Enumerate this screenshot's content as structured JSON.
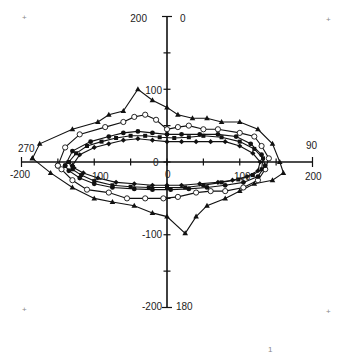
{
  "chart_data": {
    "type": "scatter",
    "subtype": "closed-loop line with markers (polar-style plot on Cartesian axes)",
    "title": "",
    "xlabel": "",
    "ylabel": "",
    "xlim": [
      -200,
      200
    ],
    "ylim": [
      -200,
      200
    ],
    "x_ticks": [
      -200,
      -150,
      -100,
      -50,
      0,
      50,
      100,
      150,
      200
    ],
    "y_ticks": [
      -200,
      -150,
      -100,
      -50,
      0,
      50,
      100,
      150,
      200
    ],
    "axis_tick_labels": {
      "y_top": "200",
      "y_upper": "100",
      "y_lower": "-100",
      "y_bottom": "-200",
      "x_left": "-200",
      "x_right": "200",
      "center_overlapping": [
        "0",
        "100",
        "100",
        "0"
      ]
    },
    "angle_labels": {
      "top": "0",
      "right": "90",
      "bottom": "180",
      "left": "270"
    },
    "grid": false,
    "legend": null,
    "series": [
      {
        "name": "series-triangle",
        "marker": "filled-triangle",
        "points": [
          [
            -185,
            5
          ],
          [
            -175,
            25
          ],
          [
            -130,
            45
          ],
          [
            -95,
            55
          ],
          [
            -80,
            65
          ],
          [
            -60,
            70
          ],
          [
            -40,
            100
          ],
          [
            -20,
            85
          ],
          [
            0,
            75
          ],
          [
            15,
            65
          ],
          [
            35,
            60
          ],
          [
            55,
            60
          ],
          [
            75,
            55
          ],
          [
            100,
            55
          ],
          [
            125,
            45
          ],
          [
            145,
            25
          ],
          [
            155,
            0
          ],
          [
            160,
            -15
          ],
          [
            145,
            -25
          ],
          [
            120,
            -30
          ],
          [
            100,
            -40
          ],
          [
            80,
            -50
          ],
          [
            55,
            -60
          ],
          [
            40,
            -75
          ],
          [
            25,
            -98
          ],
          [
            0,
            -75
          ],
          [
            -20,
            -70
          ],
          [
            -45,
            -60
          ],
          [
            -75,
            -55
          ],
          [
            -100,
            -50
          ],
          [
            -130,
            -35
          ],
          [
            -160,
            -15
          ],
          [
            -185,
            5
          ]
        ]
      },
      {
        "name": "series-open-circle",
        "marker": "open-circle",
        "points": [
          [
            -150,
            -5
          ],
          [
            -140,
            20
          ],
          [
            -120,
            38
          ],
          [
            -85,
            48
          ],
          [
            -60,
            55
          ],
          [
            -45,
            62
          ],
          [
            -30,
            65
          ],
          [
            -15,
            58
          ],
          [
            0,
            45
          ],
          [
            15,
            48
          ],
          [
            30,
            50
          ],
          [
            50,
            45
          ],
          [
            70,
            45
          ],
          [
            100,
            40
          ],
          [
            120,
            35
          ],
          [
            130,
            22
          ],
          [
            140,
            5
          ],
          [
            135,
            -10
          ],
          [
            125,
            -25
          ],
          [
            105,
            -35
          ],
          [
            80,
            -40
          ],
          [
            60,
            -40
          ],
          [
            40,
            -42
          ],
          [
            15,
            -48
          ],
          [
            -5,
            -50
          ],
          [
            -30,
            -50
          ],
          [
            -55,
            -50
          ],
          [
            -80,
            -42
          ],
          [
            -110,
            -38
          ],
          [
            -130,
            -25
          ],
          [
            -145,
            -10
          ],
          [
            -150,
            -5
          ]
        ]
      },
      {
        "name": "series-filled-circle",
        "marker": "filled-circle",
        "points": [
          [
            -140,
            -5
          ],
          [
            -130,
            15
          ],
          [
            -105,
            28
          ],
          [
            -80,
            35
          ],
          [
            -60,
            40
          ],
          [
            -40,
            42
          ],
          [
            -20,
            40
          ],
          [
            0,
            38
          ],
          [
            20,
            38
          ],
          [
            45,
            38
          ],
          [
            70,
            38
          ],
          [
            95,
            35
          ],
          [
            115,
            25
          ],
          [
            130,
            10
          ],
          [
            135,
            -5
          ],
          [
            125,
            -20
          ],
          [
            105,
            -28
          ],
          [
            80,
            -32
          ],
          [
            55,
            -35
          ],
          [
            30,
            -37
          ],
          [
            5,
            -38
          ],
          [
            -20,
            -38
          ],
          [
            -45,
            -37
          ],
          [
            -75,
            -35
          ],
          [
            -100,
            -30
          ],
          [
            -120,
            -22
          ],
          [
            -135,
            -12
          ],
          [
            -140,
            -5
          ]
        ]
      },
      {
        "name": "series-filled-diamond",
        "marker": "filled-diamond",
        "points": [
          [
            -130,
            -5
          ],
          [
            -120,
            10
          ],
          [
            -100,
            20
          ],
          [
            -80,
            25
          ],
          [
            -60,
            30
          ],
          [
            -40,
            32
          ],
          [
            -20,
            30
          ],
          [
            0,
            28
          ],
          [
            20,
            28
          ],
          [
            40,
            28
          ],
          [
            60,
            28
          ],
          [
            80,
            28
          ],
          [
            100,
            22
          ],
          [
            118,
            12
          ],
          [
            128,
            0
          ],
          [
            125,
            -12
          ],
          [
            110,
            -20
          ],
          [
            90,
            -25
          ],
          [
            70,
            -28
          ],
          [
            45,
            -30
          ],
          [
            20,
            -32
          ],
          [
            0,
            -32
          ],
          [
            -20,
            -32
          ],
          [
            -45,
            -30
          ],
          [
            -70,
            -28
          ],
          [
            -95,
            -22
          ],
          [
            -115,
            -15
          ],
          [
            -128,
            -8
          ],
          [
            -130,
            -5
          ]
        ]
      },
      {
        "name": "series-filled-square",
        "marker": "filled-square",
        "points": [
          [
            -135,
            0
          ],
          [
            -125,
            12
          ],
          [
            -110,
            22
          ],
          [
            -90,
            28
          ],
          [
            -70,
            33
          ],
          [
            -50,
            36
          ],
          [
            -30,
            36
          ],
          [
            -10,
            34
          ],
          [
            10,
            33
          ],
          [
            30,
            34
          ],
          [
            50,
            36
          ],
          [
            75,
            34
          ],
          [
            100,
            28
          ],
          [
            120,
            18
          ],
          [
            132,
            5
          ],
          [
            130,
            -10
          ],
          [
            118,
            -18
          ],
          [
            98,
            -24
          ],
          [
            75,
            -28
          ],
          [
            50,
            -32
          ],
          [
            25,
            -35
          ],
          [
            0,
            -35
          ],
          [
            -25,
            -35
          ],
          [
            -50,
            -34
          ],
          [
            -75,
            -32
          ],
          [
            -100,
            -26
          ],
          [
            -118,
            -18
          ],
          [
            -130,
            -10
          ],
          [
            -135,
            0
          ]
        ]
      }
    ]
  },
  "page": {
    "corner_marks": [
      "+",
      "+",
      "+",
      "+"
    ],
    "page_number": "1",
    "top_right_faint_text": "..."
  }
}
